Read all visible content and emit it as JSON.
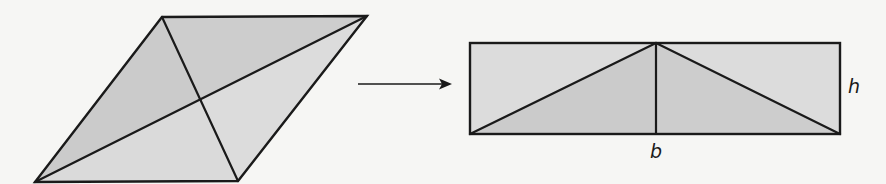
{
  "figure": {
    "colors": {
      "background": "#f6f6f4",
      "stroke": "#1a1a1a",
      "fill_dark": "#cbcbcb",
      "fill_light": "#dcdcdc"
    },
    "rhombus": {
      "vertices": {
        "top_left": [
          162,
          17
        ],
        "top_right": [
          367,
          16
        ],
        "bottom_right": [
          238,
          181
        ],
        "bottom_left": [
          35,
          182
        ]
      },
      "diagonals": [
        "top_left-bottom_right",
        "top_right-bottom_left"
      ],
      "center": [
        200,
        99
      ]
    },
    "arrow": {
      "from": [
        358,
        84
      ],
      "to": [
        452,
        84
      ],
      "direction": "right"
    },
    "rectangle": {
      "x": 470,
      "y": 43,
      "width": 370,
      "height": 91,
      "midline_x": 656,
      "labels": {
        "height": "h",
        "base": "b"
      }
    }
  }
}
